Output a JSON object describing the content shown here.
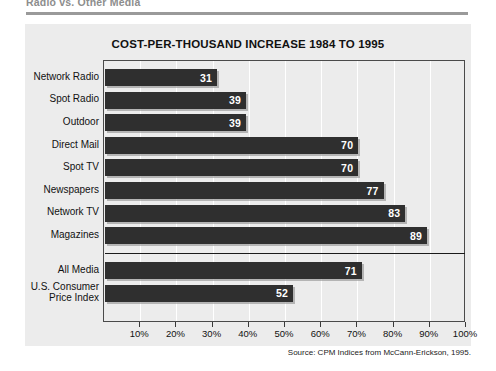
{
  "page": {
    "caption": "Radio vs. Other Media",
    "source_note": "Source: CPM Indices from McCann-Erickson, 1995."
  },
  "chart_data": {
    "type": "bar",
    "orientation": "horizontal",
    "title": "COST-PER-THOUSAND INCREASE 1984 TO 1995",
    "xlabel": "",
    "ylabel": "",
    "xlim": [
      0,
      100
    ],
    "xticks": [
      10,
      20,
      30,
      40,
      50,
      60,
      70,
      80,
      90,
      100
    ],
    "xtick_labels": [
      "10%",
      "20%",
      "30%",
      "40%",
      "50%",
      "60%",
      "70%",
      "80%",
      "90%",
      "100%"
    ],
    "grid": true,
    "legend": "none",
    "value_suffix": "",
    "categories": [
      "Network Radio",
      "Spot Radio",
      "Outdoor",
      "Direct Mail",
      "Spot TV",
      "Newspapers",
      "Network TV",
      "Magazines",
      "All Media",
      "U.S. Consumer Price Index"
    ],
    "values": [
      31,
      39,
      39,
      70,
      70,
      77,
      83,
      89,
      71,
      52
    ],
    "bars": [
      {
        "label": "Network Radio",
        "value": 31,
        "value_text": "31",
        "group": "media"
      },
      {
        "label": "Spot Radio",
        "value": 39,
        "value_text": "39",
        "group": "media"
      },
      {
        "label": "Outdoor",
        "value": 39,
        "value_text": "39",
        "group": "media"
      },
      {
        "label": "Direct Mail",
        "value": 70,
        "value_text": "70",
        "group": "media"
      },
      {
        "label": "Spot TV",
        "value": 70,
        "value_text": "70",
        "group": "media"
      },
      {
        "label": "Newspapers",
        "value": 77,
        "value_text": "77",
        "group": "media"
      },
      {
        "label": "Network TV",
        "value": 83,
        "value_text": "83",
        "group": "media"
      },
      {
        "label": "Magazines",
        "value": 89,
        "value_text": "89",
        "group": "media"
      },
      {
        "label": "All Media",
        "value": 71,
        "value_text": "71",
        "group": "summary"
      },
      {
        "label": "U.S. Consumer Price Index",
        "value": 52,
        "value_text": "52",
        "group": "summary"
      }
    ],
    "label_lines": [
      [
        "Network Radio"
      ],
      [
        "Spot Radio"
      ],
      [
        "Outdoor"
      ],
      [
        "Direct Mail"
      ],
      [
        "Spot TV"
      ],
      [
        "Newspapers"
      ],
      [
        "Network TV"
      ],
      [
        "Magazines"
      ],
      [
        "All Media"
      ],
      [
        "U.S. Consumer",
        "Price Index"
      ]
    ],
    "colors": {
      "bar": "#2f2f2f",
      "panel_bg": "#ececec",
      "gridline": "#ffffff",
      "frame": "#4a4a4a",
      "value_text": "#ffffff",
      "separator": "#1a1a1a"
    }
  }
}
